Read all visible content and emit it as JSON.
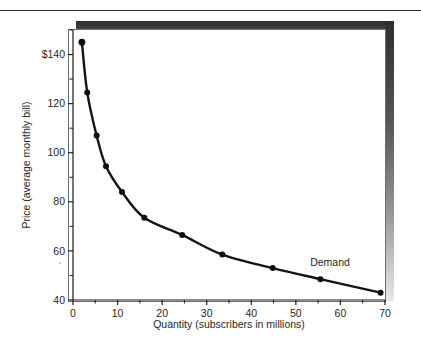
{
  "figure": {
    "background_color": "#ffffff",
    "frame_border_color": "#6e6e6e",
    "shadow_color": "#2e2e2e",
    "curve_color": "#141414",
    "point_color": "#0d0d0d"
  },
  "chart_data": {
    "type": "line",
    "title": "",
    "subtitle": "",
    "xlabel": "Quantity (subscribers in millions)",
    "ylabel": "Price (average monthly bill)",
    "xlim": [
      0,
      70
    ],
    "ylim": [
      40,
      150
    ],
    "grid": false,
    "legend_position": "inline-annotation",
    "x_ticks": [
      0,
      10,
      20,
      30,
      40,
      50,
      60,
      70
    ],
    "x_tick_labels": [
      "0",
      "10",
      "20",
      "30",
      "40",
      "50",
      "60",
      "70"
    ],
    "x_minor_ticks": [
      5,
      15,
      25,
      35,
      45,
      55,
      65
    ],
    "y_ticks": [
      40,
      60,
      80,
      100,
      120,
      140
    ],
    "y_tick_labels": [
      "40",
      "60",
      "80",
      "100",
      "120",
      "$140"
    ],
    "y_minor_ticks": [
      50,
      70,
      90,
      110,
      130,
      150
    ],
    "series": [
      {
        "name": "Demand",
        "annotation": "Demand",
        "marker": "filled-circle",
        "x": [
          2.0,
          3.2,
          5.3,
          7.4,
          11.0,
          16.0,
          24.5,
          33.5,
          44.8,
          55.5,
          69.0
        ],
        "y": [
          145.0,
          124.5,
          107.0,
          94.5,
          84.0,
          73.5,
          66.5,
          58.5,
          53.0,
          48.5,
          43.0
        ],
        "points": [
          {
            "x": 2.0,
            "y": 145.0
          },
          {
            "x": 3.2,
            "y": 124.5
          },
          {
            "x": 5.3,
            "y": 107.0
          },
          {
            "x": 7.4,
            "y": 94.5
          },
          {
            "x": 11.0,
            "y": 84.0
          },
          {
            "x": 16.0,
            "y": 73.5
          },
          {
            "x": 24.5,
            "y": 66.5
          },
          {
            "x": 33.5,
            "y": 58.5
          },
          {
            "x": 44.8,
            "y": 53.0
          },
          {
            "x": 55.5,
            "y": 48.5
          },
          {
            "x": 69.0,
            "y": 43.0
          }
        ]
      }
    ]
  }
}
